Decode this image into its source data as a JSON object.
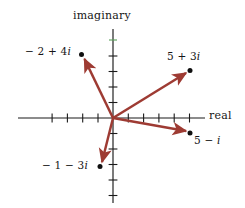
{
  "figure": {
    "kind": "argand-diagram",
    "axis_labels": {
      "imaginary": "imaginary",
      "real": "real"
    },
    "colors": {
      "arrow": "#9e3b33",
      "axis": "#1a1a1a",
      "text": "#161616",
      "point": "#101010",
      "artifact_green": "#5aa05a",
      "background": "#ffffff"
    }
  },
  "chart_data": {
    "type": "scatter",
    "title": "",
    "subtitle": "",
    "xlabel": "real",
    "ylabel": "imaginary",
    "xlim": [
      -5,
      6
    ],
    "ylim": [
      -6,
      5
    ],
    "grid": false,
    "legend": null,
    "x_ticks": [
      -4,
      -3,
      -2,
      -1,
      1,
      2,
      3,
      4,
      5
    ],
    "y_ticks": [
      -5,
      -4,
      -3,
      -2,
      -1,
      1,
      2,
      3,
      4
    ],
    "x_tick_labels": [
      "",
      "",
      "",
      "",
      "",
      "",
      "",
      "",
      ""
    ],
    "y_tick_labels": [
      "",
      "",
      "",
      "",
      "",
      "",
      "",
      "",
      ""
    ],
    "origin": [
      0,
      0
    ],
    "series": [
      {
        "name": "complex numbers",
        "style": "vectors-from-origin-with-arrowheads",
        "points": [
          {
            "label": "− 2 + 4i",
            "re": -2,
            "im": 4,
            "x": -2,
            "y": 4
          },
          {
            "label": "5 + 3i",
            "re": 5,
            "im": 3,
            "x": 5,
            "y": 3
          },
          {
            "label": "5 − i",
            "re": 5,
            "im": -1,
            "x": 5,
            "y": -1
          },
          {
            "label": "− 1 − 3i",
            "re": -1,
            "im": -3,
            "x": -1,
            "y": -3
          }
        ]
      }
    ],
    "annotations": [
      {
        "text": "imaginary",
        "position": "top-center",
        "role": "axis-title"
      },
      {
        "text": "real",
        "position": "right-of-x-axis",
        "role": "axis-title"
      }
    ]
  },
  "labels": {
    "imaginary": "imaginary",
    "real": "real",
    "p1": "− 2 + 4i",
    "p2": "5 + 3i",
    "p3": "5 − i",
    "p4": "− 1 − 3i"
  }
}
